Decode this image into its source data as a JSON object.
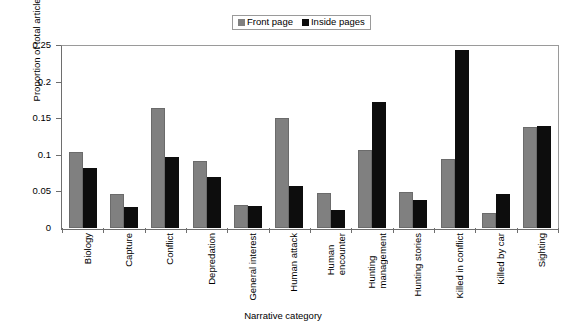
{
  "chart_data": {
    "type": "bar",
    "title": "",
    "xlabel": "Narrative category",
    "ylabel": "Proportion of total articles",
    "ylim": [
      0,
      0.25
    ],
    "ytick_labels": [
      "0",
      "0.05",
      "0.1",
      "0.15",
      "0.2",
      "0.25"
    ],
    "ytick_values": [
      0,
      0.05,
      0.1,
      0.15,
      0.2,
      0.25
    ],
    "grid": false,
    "legend_position": "top-center",
    "categories": [
      "Biology",
      "Capture",
      "Conflict",
      "Depredation",
      "General interest",
      "Human attack",
      "Human\nencounter",
      "Hunting\nmanagement",
      "Hunting stories",
      "Killed in conflict",
      "Killed by car",
      "Sighting"
    ],
    "series": [
      {
        "name": "Front page",
        "color": "#808080",
        "values": [
          0.104,
          0.046,
          0.164,
          0.091,
          0.031,
          0.15,
          0.048,
          0.106,
          0.049,
          0.094,
          0.02,
          0.138
        ]
      },
      {
        "name": "Inside pages",
        "color": "#0d0d0d",
        "values": [
          0.082,
          0.029,
          0.097,
          0.07,
          0.03,
          0.057,
          0.024,
          0.172,
          0.038,
          0.243,
          0.046,
          0.14
        ]
      }
    ]
  },
  "legend": {
    "entries": [
      {
        "label": "Front page",
        "swatch": "front"
      },
      {
        "label": "Inside pages",
        "swatch": "inside"
      }
    ]
  },
  "axes": {
    "y_title": "Proportion of total articles",
    "x_title": "Narrative category"
  },
  "colors": {
    "front_page": "#808080",
    "inside_pages": "#0d0d0d",
    "axis": "#6e6e6e",
    "frame": "#9a9a9a",
    "background": "#ffffff"
  }
}
